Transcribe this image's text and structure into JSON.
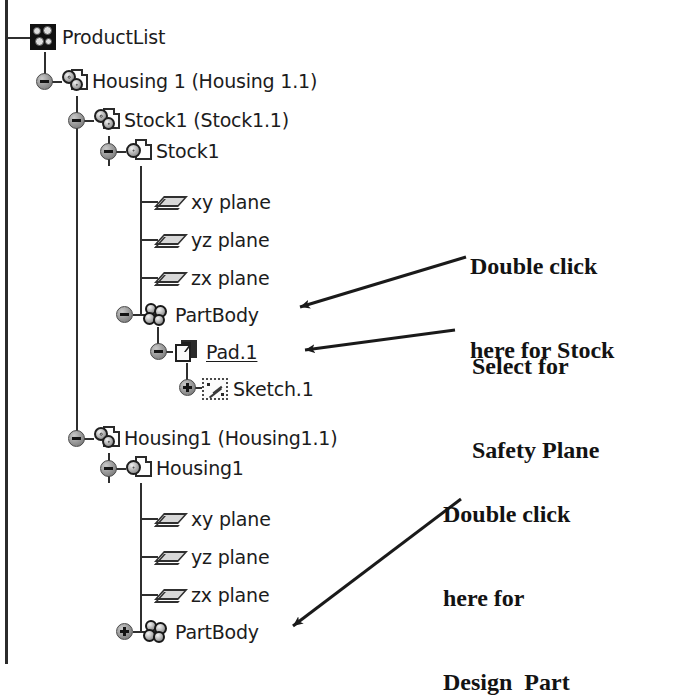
{
  "tree": {
    "name": "specification-tree",
    "rows": [
      {
        "id": "productlist",
        "label": "ProductList",
        "icon": "product-icon",
        "depth": 0,
        "handle": "minus",
        "selected": false
      },
      {
        "id": "housing-1-instance",
        "label": "Housing 1 (Housing 1.1)",
        "icon": "product-document-icon",
        "depth": 1,
        "handle": "minus",
        "selected": false
      },
      {
        "id": "stock1-instance",
        "label": "Stock1 (Stock1.1)",
        "icon": "product-document-icon",
        "depth": 2,
        "handle": "minus",
        "selected": false
      },
      {
        "id": "stock1-part",
        "label": "Stock1",
        "icon": "part-document-icon",
        "depth": 3,
        "handle": "minus",
        "selected": false
      },
      {
        "id": "stock1-xy-plane",
        "label": "xy plane",
        "icon": "plane-icon",
        "depth": 4,
        "handle": "none",
        "selected": false
      },
      {
        "id": "stock1-yz-plane",
        "label": "yz plane",
        "icon": "plane-icon",
        "depth": 4,
        "handle": "none",
        "selected": false
      },
      {
        "id": "stock1-zx-plane",
        "label": "zx plane",
        "icon": "plane-icon",
        "depth": 4,
        "handle": "none",
        "selected": false
      },
      {
        "id": "stock1-partbody",
        "label": "PartBody",
        "icon": "partbody-icon",
        "depth": 4,
        "handle": "minus",
        "selected": false
      },
      {
        "id": "stock1-pad1",
        "label": "Pad.1",
        "icon": "pad-icon",
        "depth": 5,
        "handle": "minus",
        "selected": true
      },
      {
        "id": "stock1-sketch1",
        "label": "Sketch.1",
        "icon": "sketch-icon",
        "depth": 6,
        "handle": "plus",
        "selected": false
      },
      {
        "id": "housing1-instance",
        "label": "Housing1 (Housing1.1)",
        "icon": "product-document-icon",
        "depth": 2,
        "handle": "minus",
        "selected": false
      },
      {
        "id": "housing1-part",
        "label": "Housing1",
        "icon": "part-document-icon",
        "depth": 3,
        "handle": "minus",
        "selected": false
      },
      {
        "id": "housing1-xy-plane",
        "label": "xy plane",
        "icon": "plane-icon",
        "depth": 4,
        "handle": "none",
        "selected": false
      },
      {
        "id": "housing1-yz-plane",
        "label": "yz plane",
        "icon": "plane-icon",
        "depth": 4,
        "handle": "none",
        "selected": false
      },
      {
        "id": "housing1-zx-plane",
        "label": "zx plane",
        "icon": "plane-icon",
        "depth": 4,
        "handle": "none",
        "selected": false
      },
      {
        "id": "housing1-partbody",
        "label": "PartBody",
        "icon": "partbody-icon",
        "depth": 4,
        "handle": "plus",
        "selected": false
      }
    ]
  },
  "annotations": [
    {
      "id": "note-stock",
      "line1": "Double click",
      "line2": "here for Stock",
      "target": "stock1-partbody"
    },
    {
      "id": "note-safety-plane",
      "line1": "Select for",
      "line2": "Safety Plane",
      "target": "stock1-pad1"
    },
    {
      "id": "note-design-part",
      "line1": "Double click",
      "line2": "here for",
      "line3": "Design  Part",
      "target": "housing1-partbody"
    }
  ],
  "colors": {
    "background": "#ffffff",
    "text": "#1c1c1c",
    "line": "#2f2f2f",
    "annotation": "#131313"
  }
}
